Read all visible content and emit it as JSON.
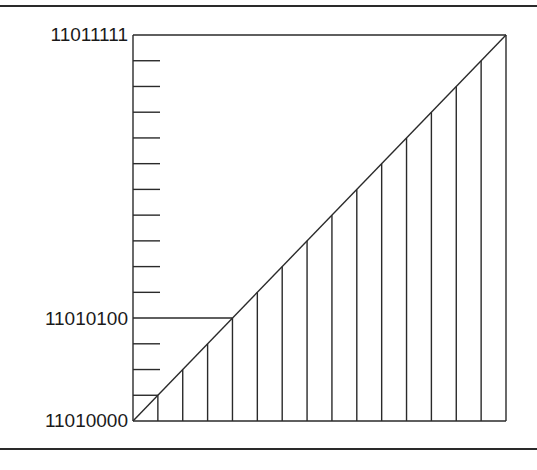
{
  "diagram": {
    "type": "staircase-mapping",
    "labels": {
      "top": "11011111",
      "middle": "11010100",
      "bottom": "11010000"
    },
    "levels": 16,
    "highlight_level": 4,
    "frame": {
      "left": 133,
      "top": 35,
      "right": 506,
      "bottom": 421
    },
    "line_color": "#2a2a2a"
  }
}
